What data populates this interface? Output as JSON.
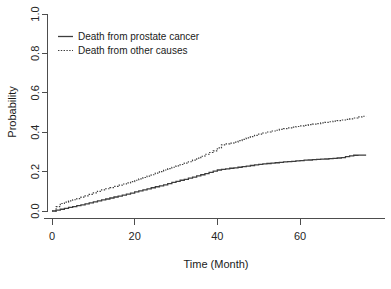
{
  "chart_data": {
    "type": "line",
    "title": "",
    "xlabel": "Time (Month)",
    "ylabel": "Probability",
    "xlim": [
      -2,
      78
    ],
    "ylim": [
      0.0,
      1.0
    ],
    "xticks": [
      0,
      20,
      40,
      60
    ],
    "xtick_labels": [
      "0",
      "20",
      "40",
      "60"
    ],
    "yticks": [
      0.0,
      0.2,
      0.4,
      0.6,
      0.8,
      1.0
    ],
    "ytick_labels": [
      "0.0",
      "0.2",
      "0.4",
      "0.6",
      "0.8",
      "1.0"
    ],
    "grid": false,
    "legend_position": "top-left",
    "series": [
      {
        "name": "Death from prostate cancer",
        "style": "solid",
        "color": "#3d3d3d",
        "x": [
          0,
          1,
          2,
          3,
          4,
          5,
          6,
          7,
          8,
          9,
          10,
          11,
          12,
          13,
          14,
          15,
          16,
          17,
          18,
          19,
          20,
          21,
          22,
          23,
          24,
          25,
          26,
          27,
          28,
          29,
          30,
          31,
          32,
          33,
          34,
          35,
          36,
          37,
          38,
          39,
          40,
          41,
          42,
          43,
          44,
          45,
          46,
          47,
          48,
          49,
          50,
          51,
          52,
          53,
          54,
          55,
          56,
          57,
          58,
          59,
          60,
          61,
          62,
          63,
          64,
          65,
          66,
          67,
          68,
          69,
          70,
          71,
          72,
          73,
          74,
          75,
          76
        ],
        "y": [
          0.0,
          0.004,
          0.009,
          0.013,
          0.018,
          0.022,
          0.027,
          0.031,
          0.036,
          0.041,
          0.046,
          0.051,
          0.056,
          0.061,
          0.066,
          0.071,
          0.076,
          0.081,
          0.086,
          0.091,
          0.097,
          0.102,
          0.107,
          0.112,
          0.118,
          0.123,
          0.128,
          0.133,
          0.139,
          0.145,
          0.15,
          0.156,
          0.161,
          0.167,
          0.172,
          0.178,
          0.184,
          0.19,
          0.196,
          0.202,
          0.208,
          0.211,
          0.214,
          0.217,
          0.219,
          0.222,
          0.225,
          0.228,
          0.231,
          0.234,
          0.237,
          0.239,
          0.241,
          0.243,
          0.245,
          0.247,
          0.249,
          0.251,
          0.252,
          0.254,
          0.256,
          0.258,
          0.259,
          0.261,
          0.262,
          0.263,
          0.264,
          0.266,
          0.267,
          0.269,
          0.271,
          0.276,
          0.28,
          0.283,
          0.284,
          0.284,
          0.284
        ]
      },
      {
        "name": "Death from other causes",
        "style": "dotted",
        "color": "#3d3d3d",
        "x": [
          0,
          1,
          2,
          3,
          4,
          5,
          6,
          7,
          8,
          9,
          10,
          11,
          12,
          13,
          14,
          15,
          16,
          17,
          18,
          19,
          20,
          21,
          22,
          23,
          24,
          25,
          26,
          27,
          28,
          29,
          30,
          31,
          32,
          33,
          34,
          35,
          36,
          37,
          38,
          39,
          40,
          41,
          42,
          43,
          44,
          45,
          46,
          47,
          48,
          49,
          50,
          51,
          52,
          53,
          54,
          55,
          56,
          57,
          58,
          59,
          60,
          61,
          62,
          63,
          64,
          65,
          66,
          67,
          68,
          69,
          70,
          71,
          72,
          73,
          74,
          75,
          76
        ],
        "y": [
          0.0,
          0.022,
          0.038,
          0.045,
          0.051,
          0.057,
          0.063,
          0.07,
          0.077,
          0.084,
          0.092,
          0.1,
          0.107,
          0.113,
          0.119,
          0.125,
          0.131,
          0.137,
          0.143,
          0.149,
          0.156,
          0.163,
          0.17,
          0.177,
          0.184,
          0.192,
          0.2,
          0.208,
          0.215,
          0.222,
          0.229,
          0.236,
          0.243,
          0.25,
          0.258,
          0.268,
          0.278,
          0.288,
          0.297,
          0.305,
          0.32,
          0.336,
          0.341,
          0.345,
          0.35,
          0.357,
          0.364,
          0.371,
          0.378,
          0.384,
          0.39,
          0.396,
          0.401,
          0.406,
          0.41,
          0.414,
          0.418,
          0.422,
          0.426,
          0.429,
          0.432,
          0.435,
          0.438,
          0.441,
          0.444,
          0.447,
          0.45,
          0.453,
          0.456,
          0.459,
          0.462,
          0.465,
          0.468,
          0.472,
          0.478,
          0.481,
          0.481
        ]
      }
    ],
    "legend": [
      {
        "label": "Death from prostate cancer",
        "style": "solid"
      },
      {
        "label": "Death from other causes",
        "style": "dotted"
      }
    ]
  },
  "colors": {
    "axis": "#4d4d4d",
    "text": "#1a1a1a",
    "series": "#3d3d3d",
    "background": "#ffffff"
  }
}
